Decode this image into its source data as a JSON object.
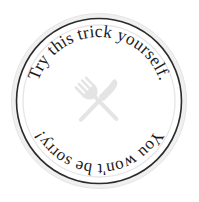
{
  "badge": {
    "top_text": "Try this trick yourself.",
    "bottom_text": "You won't be sorry!",
    "center_icon": "fork-and-knife-icon",
    "colors": {
      "background": "#ffffff",
      "outer_band": "#eeeeee",
      "outer_band_edge": "#e2e2e2",
      "ring_stroke": "#2b2b2b",
      "inner_ring": "#e6e6e6",
      "face": "#ffffff",
      "text": "#1b1b1b",
      "icon": "#e4e4e4"
    },
    "geometry": {
      "center_x": 99,
      "center_y": 101,
      "outer_radius": 88,
      "ring_radius": 83,
      "inner_ring_radius": 76,
      "text_radius_top": 64,
      "text_radius_bottom": 63
    }
  }
}
